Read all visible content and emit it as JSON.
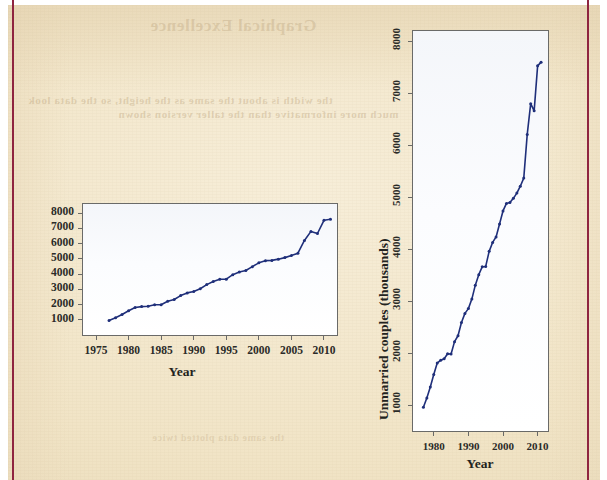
{
  "page": {
    "background_color": "#f1e4c6",
    "rule_color": "#8f2540",
    "bleed_text": {
      "title": "Graphical Excellence",
      "line_1": "the width is about the same as the height, so the data look",
      "line_2": "much more informative than the taller version shown",
      "line_3": "the same data plotted twice"
    }
  },
  "charts": [
    {
      "id": "chart-wide",
      "name": "wide-aspect-chart",
      "axis_color": "#6a6a68",
      "series_color": "#1f2f7a",
      "y_tick_orientation": "horizontal",
      "x_tick_orientation": "horizontal"
    },
    {
      "id": "chart-tall",
      "name": "tall-aspect-chart",
      "axis_color": "#6a6a68",
      "series_color": "#1f2f7a",
      "y_tick_orientation": "rotated-90",
      "x_tick_orientation": "horizontal"
    }
  ],
  "chart_data": [
    {
      "type": "line",
      "name": "wide-aspect-chart",
      "title": "",
      "xlabel": "Year",
      "ylabel": "Unmarried couples (thousands)",
      "xlim": [
        1973,
        2012
      ],
      "ylim": [
        0,
        8600
      ],
      "xticks": [
        1975,
        1980,
        1985,
        1990,
        1995,
        2000,
        2005,
        2010
      ],
      "yticks": [
        1000,
        2000,
        3000,
        4000,
        5000,
        6000,
        7000,
        8000
      ],
      "grid": false,
      "legend": "none",
      "markers": true,
      "aspect": "wide",
      "x": [
        1977,
        1978,
        1979,
        1980,
        1981,
        1982,
        1983,
        1984,
        1985,
        1986,
        1987,
        1988,
        1989,
        1990,
        1991,
        1992,
        1993,
        1994,
        1995,
        1996,
        1997,
        1998,
        1999,
        2000,
        2001,
        2002,
        2003,
        2004,
        2005,
        2006,
        2007,
        2008,
        2009,
        2010,
        2011
      ],
      "y": [
        957,
        1137,
        1346,
        1589,
        1808,
        1863,
        1891,
        1988,
        1983,
        2220,
        2334,
        2588,
        2764,
        2856,
        3039,
        3308,
        3510,
        3661,
        3668,
        3958,
        4130,
        4236,
        4486,
        4736,
        4881,
        4898,
        4979,
        5080,
        5212,
        5368,
        6209,
        6801,
        6663,
        7529,
        7600
      ]
    },
    {
      "type": "line",
      "name": "tall-aspect-chart",
      "title": "",
      "xlabel": "Year",
      "ylabel": "Unmarried couples (thousands)",
      "xlim": [
        1974,
        2013
      ],
      "ylim": [
        500,
        8200
      ],
      "xticks": [
        1980,
        1990,
        2000,
        2010
      ],
      "yticks": [
        1000,
        2000,
        3000,
        4000,
        5000,
        6000,
        7000,
        8000
      ],
      "grid": false,
      "legend": "none",
      "markers": true,
      "aspect": "tall",
      "x": [
        1977,
        1978,
        1979,
        1980,
        1981,
        1982,
        1983,
        1984,
        1985,
        1986,
        1987,
        1988,
        1989,
        1990,
        1991,
        1992,
        1993,
        1994,
        1995,
        1996,
        1997,
        1998,
        1999,
        2000,
        2001,
        2002,
        2003,
        2004,
        2005,
        2006,
        2007,
        2008,
        2009,
        2010,
        2011
      ],
      "y": [
        957,
        1137,
        1346,
        1589,
        1808,
        1863,
        1891,
        1988,
        1983,
        2220,
        2334,
        2588,
        2764,
        2856,
        3039,
        3308,
        3510,
        3661,
        3668,
        3958,
        4130,
        4236,
        4486,
        4736,
        4881,
        4898,
        4979,
        5080,
        5212,
        5368,
        6209,
        6801,
        6663,
        7529,
        7600
      ]
    }
  ]
}
